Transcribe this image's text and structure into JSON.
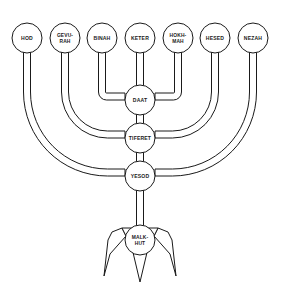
{
  "diagram": {
    "background_color": "#ffffff",
    "line_color": "#1a1a1a",
    "width": 281,
    "height": 286
  },
  "top_nodes": [
    {
      "id": "hod",
      "label": "HOD",
      "lines": [
        "HOD"
      ],
      "cx": 27,
      "cy": 38,
      "r": 15
    },
    {
      "id": "gevurah",
      "label": "GEVU-RAH",
      "lines": [
        "GEVU-",
        "RAH"
      ],
      "cx": 65,
      "cy": 38,
      "r": 15
    },
    {
      "id": "binah",
      "label": "BINAH",
      "lines": [
        "BINAH"
      ],
      "cx": 102,
      "cy": 38,
      "r": 15
    },
    {
      "id": "keter",
      "label": "KETER",
      "lines": [
        "KETER"
      ],
      "cx": 140,
      "cy": 38,
      "r": 15
    },
    {
      "id": "hokhmah",
      "label": "HOKH-MAH",
      "lines": [
        "HOKH-",
        "MAH"
      ],
      "cx": 178,
      "cy": 38,
      "r": 15
    },
    {
      "id": "hesed",
      "label": "HESED",
      "lines": [
        "HESED"
      ],
      "cx": 215,
      "cy": 38,
      "r": 15
    },
    {
      "id": "nezah",
      "label": "NEZAH",
      "lines": [
        "NEZAH"
      ],
      "cx": 253,
      "cy": 38,
      "r": 15
    }
  ],
  "center_nodes": [
    {
      "id": "daat",
      "label": "DAAT",
      "lines": [
        "DAAT"
      ],
      "cx": 140,
      "cy": 100,
      "r": 15
    },
    {
      "id": "tiferet",
      "label": "TIFERET",
      "lines": [
        "TIFERET"
      ],
      "cx": 140,
      "cy": 138,
      "r": 15
    },
    {
      "id": "yesod",
      "label": "YESOD",
      "lines": [
        "YESOD"
      ],
      "cx": 140,
      "cy": 176,
      "r": 15
    },
    {
      "id": "malkhut",
      "label": "MALK-HUT",
      "lines": [
        "MALK-",
        "HUT"
      ],
      "cx": 140,
      "cy": 240,
      "r": 15
    }
  ],
  "connections": [
    {
      "from": "binah",
      "to": "daat",
      "side": "left",
      "arc": "inner"
    },
    {
      "from": "hokhmah",
      "to": "daat",
      "side": "right",
      "arc": "inner"
    },
    {
      "from": "gevurah",
      "to": "tiferet",
      "side": "left",
      "arc": "middle"
    },
    {
      "from": "hesed",
      "to": "tiferet",
      "side": "right",
      "arc": "middle"
    },
    {
      "from": "hod",
      "to": "yesod",
      "side": "left",
      "arc": "outer"
    },
    {
      "from": "nezah",
      "to": "yesod",
      "side": "right",
      "arc": "outer"
    },
    {
      "from": "keter",
      "to": "daat",
      "side": "center",
      "arc": "straight"
    },
    {
      "from": "daat",
      "to": "tiferet",
      "side": "center",
      "arc": "straight"
    },
    {
      "from": "tiferet",
      "to": "yesod",
      "side": "center",
      "arc": "straight"
    },
    {
      "from": "yesod",
      "to": "malkhut",
      "side": "center",
      "arc": "straight"
    }
  ],
  "base": {
    "name": "menorah-base",
    "prongs": [
      "left-foot",
      "center-spike",
      "right-foot"
    ]
  }
}
